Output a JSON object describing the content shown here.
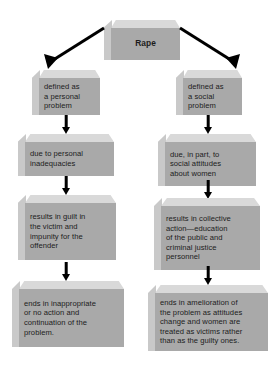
{
  "diagram": {
    "title": "Rape",
    "orientation": "two-column flowchart",
    "colors": {
      "box_front": "#a9a9a9",
      "box_top": "#d9d9d9",
      "box_side": "#c9c9c9",
      "text": "#1c1c1c",
      "arrow": "#000000",
      "background": "#ffffff"
    },
    "root": {
      "label": "Rape"
    },
    "columns": [
      {
        "name": "personal-problem-path",
        "steps": [
          {
            "label": "defined as\na personal\nproblem"
          },
          {
            "label": "due to personal\ninadequacies"
          },
          {
            "label": "results in guilt in\nthe victim and\nimpunity for the\noffender"
          },
          {
            "label": "ends in inappropriate\nor no action and\ncontinuation of the\nproblem."
          }
        ]
      },
      {
        "name": "social-problem-path",
        "steps": [
          {
            "label": "defined as\na social\nproblem"
          },
          {
            "label": "due, in part, to\nsocial attitudes\nabout women"
          },
          {
            "label": "results in collective\naction—education\nof the public and\ncriminal justice\npersonnel"
          },
          {
            "label": "ends in amelioration of\nthe problem as attitudes\nchange and women are\ntreated as victims rather\nthan as the guilty ones."
          }
        ]
      }
    ],
    "connectors": [
      {
        "name": "root-to-left",
        "type": "diagonal-arrow",
        "direction": "down-left"
      },
      {
        "name": "root-to-right",
        "type": "diagonal-arrow",
        "direction": "down-right"
      },
      {
        "name": "left-1-to-2",
        "type": "vertical-arrow"
      },
      {
        "name": "left-2-to-3",
        "type": "vertical-arrow"
      },
      {
        "name": "left-3-to-4",
        "type": "vertical-arrow"
      },
      {
        "name": "right-1-to-2",
        "type": "vertical-arrow"
      },
      {
        "name": "right-2-to-3",
        "type": "vertical-arrow"
      },
      {
        "name": "right-3-to-4",
        "type": "vertical-arrow"
      }
    ]
  }
}
